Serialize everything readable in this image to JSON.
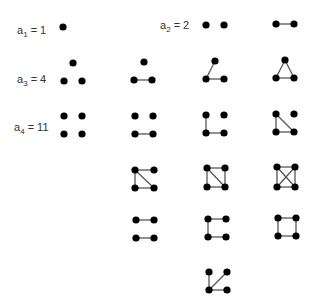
{
  "labels": [
    {
      "id": "a1",
      "var": "a",
      "sub": "1",
      "eq": " = 1",
      "x": 17,
      "y": 24
    },
    {
      "id": "a2",
      "var": "a",
      "sub": "2",
      "eq": " = 2",
      "x": 160,
      "y": 19
    },
    {
      "id": "a3",
      "var": "a",
      "sub": "3",
      "eq": " = 4",
      "x": 17,
      "y": 73
    },
    {
      "id": "a4",
      "var": "a",
      "sub": "4",
      "eq": " = 11",
      "x": 14,
      "y": 121
    }
  ],
  "style": {
    "vertex_color": "#000000",
    "edge_color": "#555555",
    "vertex_radius": 3.6,
    "edge_width": 1.3
  },
  "graphs": [
    {
      "name": "graph-n1-empty",
      "n": 1,
      "vertices": [
        [
          63,
          27
        ]
      ],
      "edges": []
    },
    {
      "name": "graph-n2-empty",
      "n": 2,
      "vertices": [
        [
          206,
          25
        ],
        [
          224,
          25
        ]
      ],
      "edges": []
    },
    {
      "name": "graph-n2-edge",
      "n": 2,
      "vertices": [
        [
          276,
          24
        ],
        [
          294,
          24
        ]
      ],
      "edges": [
        [
          0,
          1
        ]
      ]
    },
    {
      "name": "graph-n3-empty",
      "n": 3,
      "vertices": [
        [
          73,
          63
        ],
        [
          64,
          81
        ],
        [
          82,
          81
        ]
      ],
      "edges": []
    },
    {
      "name": "graph-n3-one-edge",
      "n": 3,
      "vertices": [
        [
          144,
          62
        ],
        [
          134,
          80
        ],
        [
          152,
          80
        ]
      ],
      "edges": [
        [
          1,
          2
        ]
      ]
    },
    {
      "name": "graph-n3-path",
      "n": 3,
      "vertices": [
        [
          215,
          61
        ],
        [
          206,
          79
        ],
        [
          224,
          79
        ]
      ],
      "edges": [
        [
          1,
          0
        ],
        [
          1,
          2
        ]
      ]
    },
    {
      "name": "graph-n3-triangle",
      "n": 3,
      "vertices": [
        [
          285,
          60
        ],
        [
          276,
          78
        ],
        [
          294,
          78
        ]
      ],
      "edges": [
        [
          0,
          1
        ],
        [
          0,
          2
        ],
        [
          1,
          2
        ]
      ]
    },
    {
      "name": "graph-n4-empty",
      "n": 4,
      "vertices": [
        [
          64,
          116
        ],
        [
          82,
          116
        ],
        [
          64,
          134
        ],
        [
          82,
          134
        ]
      ],
      "edges": []
    },
    {
      "name": "graph-n4-one-edge",
      "n": 4,
      "vertices": [
        [
          135,
          116
        ],
        [
          153,
          116
        ],
        [
          135,
          134
        ],
        [
          153,
          134
        ]
      ],
      "edges": [
        [
          2,
          3
        ]
      ]
    },
    {
      "name": "graph-n4-path3-plus-vertex",
      "n": 4,
      "vertices": [
        [
          206,
          115
        ],
        [
          224,
          115
        ],
        [
          206,
          133
        ],
        [
          224,
          133
        ]
      ],
      "edges": [
        [
          0,
          2
        ],
        [
          2,
          3
        ]
      ]
    },
    {
      "name": "graph-n4-triangle-plus-vertex",
      "n": 4,
      "vertices": [
        [
          276,
          114
        ],
        [
          294,
          114
        ],
        [
          276,
          132
        ],
        [
          294,
          132
        ]
      ],
      "edges": [
        [
          0,
          2
        ],
        [
          2,
          3
        ],
        [
          0,
          3
        ]
      ]
    },
    {
      "name": "graph-n4-paw",
      "n": 4,
      "vertices": [
        [
          135,
          170
        ],
        [
          154,
          170
        ],
        [
          135,
          188
        ],
        [
          154,
          188
        ]
      ],
      "edges": [
        [
          0,
          1
        ],
        [
          0,
          2
        ],
        [
          2,
          3
        ],
        [
          0,
          3
        ]
      ]
    },
    {
      "name": "graph-n4-diamond",
      "n": 4,
      "vertices": [
        [
          207,
          168
        ],
        [
          225,
          168
        ],
        [
          207,
          187
        ],
        [
          225,
          187
        ]
      ],
      "edges": [
        [
          0,
          1
        ],
        [
          0,
          2
        ],
        [
          1,
          3
        ],
        [
          2,
          3
        ],
        [
          0,
          3
        ]
      ]
    },
    {
      "name": "graph-n4-complete",
      "n": 4,
      "vertices": [
        [
          277,
          167
        ],
        [
          295,
          167
        ],
        [
          277,
          187
        ],
        [
          295,
          187
        ]
      ],
      "edges": [
        [
          0,
          1
        ],
        [
          0,
          2
        ],
        [
          1,
          3
        ],
        [
          2,
          3
        ],
        [
          0,
          3
        ],
        [
          1,
          2
        ]
      ]
    },
    {
      "name": "graph-n4-two-edges",
      "n": 4,
      "vertices": [
        [
          136,
          220
        ],
        [
          154,
          220
        ],
        [
          136,
          238
        ],
        [
          154,
          238
        ]
      ],
      "edges": [
        [
          0,
          1
        ],
        [
          2,
          3
        ]
      ]
    },
    {
      "name": "graph-n4-path4",
      "n": 4,
      "vertices": [
        [
          208,
          219
        ],
        [
          226,
          219
        ],
        [
          208,
          237
        ],
        [
          226,
          237
        ]
      ],
      "edges": [
        [
          0,
          1
        ],
        [
          0,
          2
        ],
        [
          2,
          3
        ]
      ]
    },
    {
      "name": "graph-n4-cycle4",
      "n": 4,
      "vertices": [
        [
          278,
          218
        ],
        [
          296,
          218
        ],
        [
          278,
          236
        ],
        [
          296,
          236
        ]
      ],
      "edges": [
        [
          0,
          1
        ],
        [
          0,
          2
        ],
        [
          1,
          3
        ],
        [
          2,
          3
        ]
      ]
    },
    {
      "name": "graph-n4-star",
      "n": 4,
      "vertices": [
        [
          209,
          272
        ],
        [
          227,
          272
        ],
        [
          209,
          290
        ],
        [
          227,
          290
        ]
      ],
      "edges": [
        [
          2,
          0
        ],
        [
          2,
          1
        ],
        [
          2,
          3
        ]
      ]
    }
  ]
}
